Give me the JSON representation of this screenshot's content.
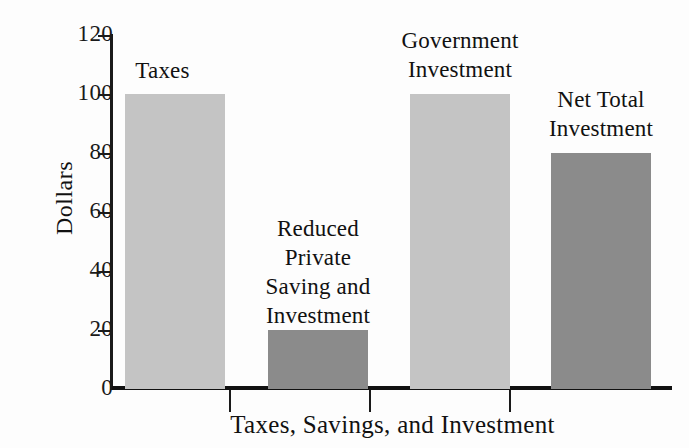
{
  "chart_data": {
    "type": "bar",
    "title": "",
    "subtitle": "",
    "xlabel": "Taxes, Savings, and Investment",
    "ylabel": "Dollars",
    "categories": [
      "Taxes",
      "Reduced Private Saving and Investment",
      "Government Investment",
      "Net Total Investment"
    ],
    "values": [
      100,
      20,
      100,
      80
    ],
    "ylim": [
      0,
      120
    ],
    "yticks": [
      0,
      20,
      40,
      60,
      80,
      100,
      120
    ],
    "ytick_labels": [
      "0",
      "20",
      "40",
      "60",
      "80",
      "100",
      "120"
    ],
    "grid": false,
    "legend": false,
    "legend_position": "none",
    "bar_label_lines": [
      [
        "Taxes"
      ],
      [
        "Reduced",
        "Private",
        "Saving and",
        "Investment"
      ],
      [
        "Government",
        "Investment"
      ],
      [
        "Net Total",
        "Investment"
      ]
    ],
    "bar_colors": [
      "#c4c4c4",
      "#8b8b8b",
      "#c4c4c4",
      "#8b8b8b"
    ],
    "colors": {
      "light_gray_bar": "#c4c4c4",
      "dark_gray_bar": "#8b8b8b",
      "axis": "#1a1a1a",
      "text": "#111111",
      "background": "#fdfdfd"
    },
    "bars": [
      {
        "label": "Taxes",
        "value": 100,
        "color": "#c4c4c4",
        "label_text": "Taxes"
      },
      {
        "label": "Reduced Private Saving and Investment",
        "value": 20,
        "color": "#8b8b8b",
        "label_text": "Reduced\nPrivate\nSaving and\nInvestment"
      },
      {
        "label": "Government Investment",
        "value": 100,
        "color": "#c4c4c4",
        "label_text": "Government\nInvestment"
      },
      {
        "label": "Net Total Investment",
        "value": 80,
        "color": "#8b8b8b",
        "label_text": "Net Total\nInvestment"
      }
    ]
  }
}
